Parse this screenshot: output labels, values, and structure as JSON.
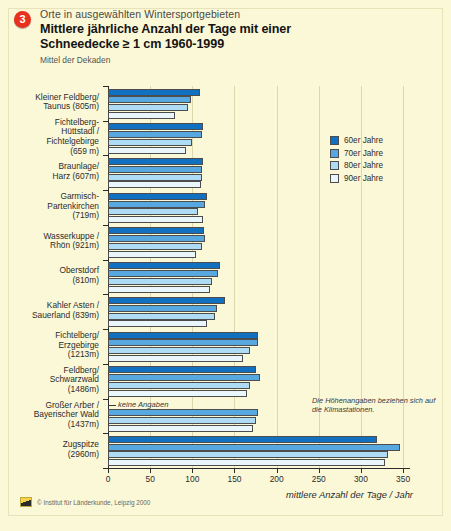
{
  "header": {
    "badge": "3",
    "kicker": "Orte in ausgewählten Wintersportgebieten",
    "title_line1": "Mittlere jährliche Anzahl der Tage mit einer",
    "title_line2": "Schneedecke ≥ 1 cm 1960-1999",
    "subtitle": "Mittel der Dekaden"
  },
  "legend": {
    "position": "right",
    "items": [
      {
        "label": "60er Jahre",
        "color": "#1270c0"
      },
      {
        "label": "70er Jahre",
        "color": "#57a8e0"
      },
      {
        "label": "80er Jahre",
        "color": "#aedcf4"
      },
      {
        "label": "90er Jahre",
        "color": "#e9f7fd"
      }
    ]
  },
  "annotations": {
    "keine_angaben": "keine Angaben",
    "hoehenangaben": "Die Höhenangaben beziehen sich auf die Klimastationen."
  },
  "footer": {
    "credit": "© Institut für Länderkunde, Leipzig 2000",
    "logo": "ifl-logo-icon"
  },
  "chart_data": {
    "type": "bar",
    "orientation": "horizontal",
    "title": "Mittlere jährliche Anzahl der Tage mit einer Schneedecke ≥ 1 cm 1960-1999",
    "subtitle": "Mittel der Dekaden",
    "xlabel": "mittlere Anzahl der Tage / Jahr",
    "ylabel": "",
    "xlim": [
      0,
      365
    ],
    "xticks": [
      0,
      50,
      100,
      150,
      200,
      250,
      300,
      350
    ],
    "grid": true,
    "categories": [
      "Kleiner Feldberg / Taunus (805 m)",
      "Fichtelberg-Hüttstadl / Fichtelgebirge (659 m)",
      "Braunlage / Harz (607 m)",
      "Garmisch-Partenkirchen (719 m)",
      "Wasserkuppe / Rhön (921 m)",
      "Oberstdorf (810 m)",
      "Kahler Asten / Sauerland (839 m)",
      "Fichtelberg / Erzgebirge (1213 m)",
      "Feldberg / Schwarzwald (1486 m)",
      "Großer Arber / Bayerischer Wald (1437 m)",
      "Zugspitze (2960 m)"
    ],
    "category_labels": [
      [
        "Kleiner Feldberg/",
        "Taunus (805m)"
      ],
      [
        "Fichtelberg-",
        "Hüttstadl /",
        "Fichtelgebirge",
        "(659 m)"
      ],
      [
        "Braunlage/",
        "Harz (607m)"
      ],
      [
        "Garmisch-",
        "Partenkirchen",
        "(719m)"
      ],
      [
        "Wasserkuppe /",
        "Rhön (921m)"
      ],
      [
        "Oberstdorf",
        "(810m)"
      ],
      [
        "Kahler Asten /",
        "Sauerland (839m)"
      ],
      [
        "Fichtelberg/",
        "Erzgebirge",
        "(1213m)"
      ],
      [
        "Feldberg/",
        "Schwarzwald",
        "(1486m)"
      ],
      [
        "Großer Arber /",
        "Bayerischer Wald",
        "(1437m)"
      ],
      [
        "Zugspitze",
        "(2960m)"
      ]
    ],
    "series": [
      {
        "name": "60er Jahre",
        "color": "#1270c0",
        "values": [
          109,
          113,
          113,
          118,
          114,
          133,
          139,
          178,
          176,
          null,
          319
        ]
      },
      {
        "name": "70er Jahre",
        "color": "#57a8e0",
        "values": [
          98,
          112,
          112,
          115,
          115,
          130,
          129,
          178,
          180,
          178,
          346
        ]
      },
      {
        "name": "80er Jahre",
        "color": "#aedcf4",
        "values": [
          95,
          100,
          112,
          107,
          112,
          123,
          127,
          168,
          168,
          175,
          332
        ]
      },
      {
        "name": "90er Jahre",
        "color": "#e9f7fd",
        "values": [
          80,
          93,
          110,
          113,
          104,
          121,
          117,
          160,
          165,
          172,
          329
        ]
      }
    ]
  }
}
